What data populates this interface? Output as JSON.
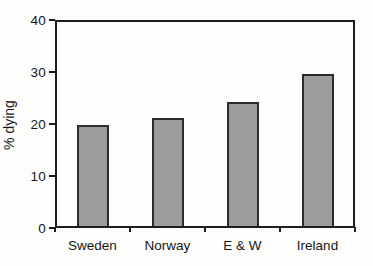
{
  "chart_data": {
    "type": "bar",
    "categories": [
      "Sweden",
      "Norway",
      "E & W",
      "Ireland"
    ],
    "values": [
      19.7,
      21,
      24,
      29.5
    ],
    "title": "",
    "xlabel": "",
    "ylabel": "% dying",
    "ylim": [
      0,
      40
    ],
    "yticks": [
      0,
      10,
      20,
      30,
      40
    ],
    "grid": false,
    "legend": "none",
    "bar_fill_color": "#9c9c9c",
    "bar_border_color": "#2b2b2b",
    "axis_color": "#1e1e1e",
    "background_color": "#fdfdfc"
  }
}
